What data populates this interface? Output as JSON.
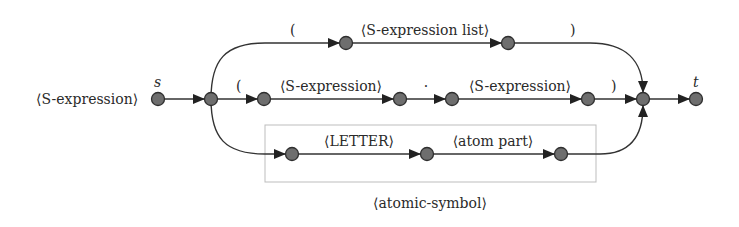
{
  "diagram": {
    "title": "⟨S-expression⟩",
    "start_label": "s",
    "end_label": "t",
    "box_label": "⟨atomic-symbol⟩",
    "edges": {
      "top_open": "(",
      "top_list": "⟨S-expression list⟩",
      "top_close": ")",
      "mid_open": "(",
      "mid_sexpr1": "⟨S-expression⟩",
      "mid_dot": "·",
      "mid_sexpr2": "⟨S-expression⟩",
      "mid_close": ")",
      "bot_letter": "⟨LETTER⟩",
      "bot_atom": "⟨atom part⟩"
    },
    "colors": {
      "node_fill": "#6e6e6e",
      "edge": "#333333",
      "box_border": "#bdbdbd"
    }
  }
}
